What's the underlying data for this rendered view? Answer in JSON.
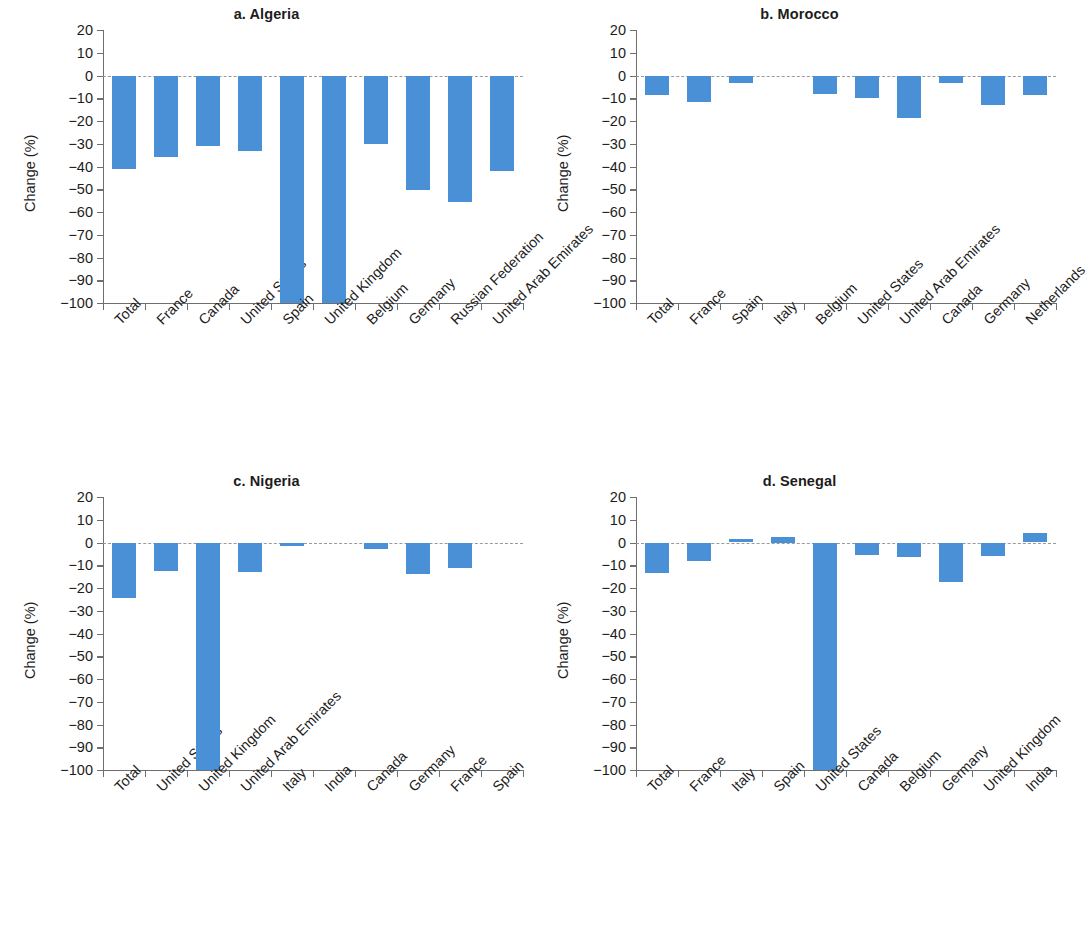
{
  "figure": {
    "ylabel": "Change (%)",
    "bar_color": "#4a90d6",
    "axis_color": "#6e6e6e",
    "zeroline_color": "#9a9a9a"
  },
  "chart_data": [
    {
      "type": "bar",
      "title": "a. Algeria",
      "xlabel": "",
      "ylabel": "Change (%)",
      "ylim": [
        -100,
        20
      ],
      "yticks": [
        20,
        10,
        0,
        -10,
        -20,
        -30,
        -40,
        -50,
        -60,
        -70,
        -80,
        -90,
        -100
      ],
      "yticklabels": [
        "20",
        "10",
        "0",
        "−10",
        "−20",
        "−30",
        "−40",
        "−50",
        "−60",
        "−70",
        "−80",
        "−90",
        "−100"
      ],
      "grid": false,
      "legend": "none",
      "categories": [
        "Total",
        "France",
        "Canada",
        "United States",
        "Spain",
        "United Kingdom",
        "Belgium",
        "Germany",
        "Russian Federation",
        "United Arab Emirates"
      ],
      "values": [
        -41,
        -36,
        -31,
        -33,
        -100,
        -100,
        -30,
        -50.5,
        -55.5,
        -42
      ]
    },
    {
      "type": "bar",
      "title": "b. Morocco",
      "xlabel": "",
      "ylabel": "Change (%)",
      "ylim": [
        -100,
        20
      ],
      "yticks": [
        20,
        10,
        0,
        -10,
        -20,
        -30,
        -40,
        -50,
        -60,
        -70,
        -80,
        -90,
        -100
      ],
      "yticklabels": [
        "20",
        "10",
        "0",
        "−10",
        "−20",
        "−30",
        "−40",
        "−50",
        "−60",
        "−70",
        "−80",
        "−90",
        "−100"
      ],
      "grid": false,
      "legend": "none",
      "categories": [
        "Total",
        "France",
        "Spain",
        "Italy",
        "Belgium",
        "United States",
        "United Arab Emirates",
        "Canada",
        "Germany",
        "Netherlands"
      ],
      "values": [
        -8.5,
        -11.5,
        -3.5,
        0,
        -8,
        -10,
        -18.5,
        -3.5,
        -13,
        -8.5
      ]
    },
    {
      "type": "bar",
      "title": "c. Nigeria",
      "xlabel": "",
      "ylabel": "Change (%)",
      "ylim": [
        -100,
        20
      ],
      "yticks": [
        20,
        10,
        0,
        -10,
        -20,
        -30,
        -40,
        -50,
        -60,
        -70,
        -80,
        -90,
        -100
      ],
      "yticklabels": [
        "20",
        "10",
        "0",
        "−10",
        "−20",
        "−30",
        "−40",
        "−50",
        "−60",
        "−70",
        "−80",
        "−90",
        "−100"
      ],
      "grid": false,
      "legend": "none",
      "categories": [
        "Total",
        "United States",
        "United Kingdom",
        "United Arab Emirates",
        "Italy",
        "India",
        "Canada",
        "Germany",
        "France",
        "Spain"
      ],
      "values": [
        -24.5,
        -12.5,
        -100,
        -13,
        -1.5,
        0,
        -3,
        -14,
        -11,
        0
      ]
    },
    {
      "type": "bar",
      "title": "d. Senegal",
      "xlabel": "",
      "ylabel": "Change (%)",
      "ylim": [
        -100,
        20
      ],
      "yticks": [
        20,
        10,
        0,
        -10,
        -20,
        -30,
        -40,
        -50,
        -60,
        -70,
        -80,
        -90,
        -100
      ],
      "yticklabels": [
        "20",
        "10",
        "0",
        "−10",
        "−20",
        "−30",
        "−40",
        "−50",
        "−60",
        "−70",
        "−80",
        "−90",
        "−100"
      ],
      "grid": false,
      "legend": "none",
      "categories": [
        "Total",
        "France",
        "Italy",
        "Spain",
        "United States",
        "Canada",
        "Belgium",
        "Germany",
        "United Kingdom",
        "India"
      ],
      "values": [
        -13.5,
        -8,
        1.5,
        2.5,
        -100,
        -5.5,
        -6.5,
        -17.5,
        -6,
        4
      ]
    }
  ]
}
